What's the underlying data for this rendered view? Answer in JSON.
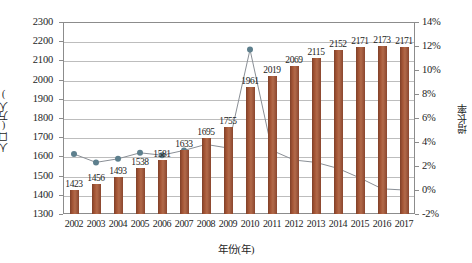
{
  "chart_data": {
    "type": "bar",
    "title": "",
    "xlabel": "年份(年)",
    "ylabel": "人口(万人)",
    "y2label": "增长率",
    "categories": [
      "2002",
      "2003",
      "2004",
      "2005",
      "2006",
      "2007",
      "2008",
      "2009",
      "2010",
      "2011",
      "2012",
      "2013",
      "2014",
      "2015",
      "2016",
      "2017"
    ],
    "series": [
      {
        "name": "人口(万人)",
        "type": "bar",
        "axis": "left",
        "values": [
          1423,
          1456,
          1493,
          1538,
          1581,
          1633,
          1695,
          1755,
          1961,
          2019,
          2069,
          2115,
          2152,
          2171,
          2173,
          2171
        ]
      },
      {
        "name": "增长率",
        "type": "line",
        "axis": "right",
        "values": [
          3.0,
          2.3,
          2.6,
          3.1,
          2.9,
          3.3,
          3.8,
          3.5,
          11.7,
          3.3,
          2.5,
          2.3,
          1.8,
          1.0,
          0.1,
          0.0
        ]
      }
    ],
    "ylim": [
      1300,
      2300
    ],
    "ytick_step": 100,
    "yticks": [
      "2300",
      "2200",
      "2100",
      "2000",
      "1900",
      "1800",
      "1700",
      "1600",
      "1500",
      "1400",
      "1300"
    ],
    "y2lim": [
      -2,
      14
    ],
    "y2tick_step": 2,
    "y2ticks": [
      "14%",
      "12%",
      "10%",
      "8%",
      "6%",
      "4%",
      "2%",
      "0%",
      "-2%"
    ],
    "grid": true,
    "legend": "none",
    "colors": {
      "bar": "#9e5135",
      "bar_dark": "#7f4029",
      "bar_light": "#b26a4a",
      "line": "#8a8f96",
      "marker": "#5d7f8d",
      "grid": "#bdbdbd",
      "axis": "#8c8c8c",
      "text": "#1d1d1d",
      "background": "#ffffff"
    }
  }
}
